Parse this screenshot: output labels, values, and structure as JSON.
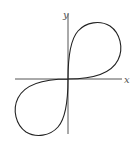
{
  "figure": {
    "axes": {
      "x_label": "x",
      "y_label": "y",
      "x_axis": {
        "x1": 15,
        "y1": 79,
        "x2": 122,
        "y2": 79
      },
      "y_axis": {
        "x1": 68,
        "y1": 14,
        "x2": 68,
        "y2": 134
      },
      "x_label_pos": {
        "x": 124,
        "y": 83
      },
      "y_label_pos": {
        "x": 63,
        "y": 18
      }
    },
    "curve": {
      "path": "M68,79 C68,60 70,40 78,31 C86,22 100,20 110,26 C120,33 124,48 118,60 C112,72 96,79 68,79 C40,79 24,86 18,98 C12,110 16,125 26,132 C36,138 50,136 58,127 C66,118 68,98 68,79 Z"
    },
    "colors": {
      "axis": "#555555",
      "curve": "#222222",
      "background": "#ffffff"
    }
  }
}
